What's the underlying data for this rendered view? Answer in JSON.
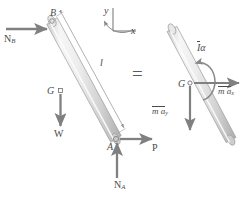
{
  "figure": {
    "type": "free-body-diagram",
    "equals_sign": "=",
    "colors": {
      "rod_light": "#f2f2f2",
      "rod_mid": "#d9d9d9",
      "rod_dark": "#b5b5b5",
      "rod_outline": "#9a9a9a",
      "arrow": "#808080",
      "text": "#4a4a4a",
      "thin_line": "#9a9a9a",
      "background": "#ffffff"
    }
  },
  "free_body_diagram": {
    "points": {
      "B": {
        "label": "B",
        "x": 52,
        "y": 21
      },
      "G": {
        "label": "G",
        "x": 60,
        "y": 92
      },
      "A": {
        "label": "A",
        "x": 113,
        "y": 142
      }
    },
    "dimension": {
      "label": "l",
      "x": 100,
      "y": 62
    },
    "forces": [
      {
        "name": "N_B",
        "label": "N",
        "subscript": "B",
        "direction": "right",
        "x": 4,
        "y": 38
      },
      {
        "name": "W",
        "label": "W",
        "subscript": "",
        "direction": "down",
        "x": 50,
        "y": 132
      },
      {
        "name": "N_A",
        "label": "N",
        "subscript": "A",
        "direction": "up",
        "x": 120,
        "y": 182
      },
      {
        "name": "P",
        "label": "P",
        "subscript": "",
        "direction": "right",
        "x": 148,
        "y": 145
      }
    ]
  },
  "kinetic_diagram": {
    "points": {
      "G": {
        "label": "G",
        "x": 181,
        "y": 88
      }
    },
    "vectors": [
      {
        "name": "moment",
        "label": "I",
        "symbol_suffix": "α",
        "overbar": true,
        "x": 196,
        "y": 48,
        "sense": "counterclockwise"
      },
      {
        "name": "max",
        "label": "m a",
        "subscript": "x",
        "overbar": true,
        "x": 218,
        "y": 98,
        "direction": "right"
      },
      {
        "name": "may",
        "label": "m a",
        "subscript": "y",
        "overbar": true,
        "x": 152,
        "y": 112,
        "direction": "down"
      }
    ]
  },
  "coordinate_frame": {
    "y_axis_label": "y",
    "x_axis_label": "x",
    "rotation_sense": "counterclockwise",
    "y_label_x": 103,
    "y_label_y": 7,
    "x_label_x": 133,
    "x_label_y": 28
  }
}
